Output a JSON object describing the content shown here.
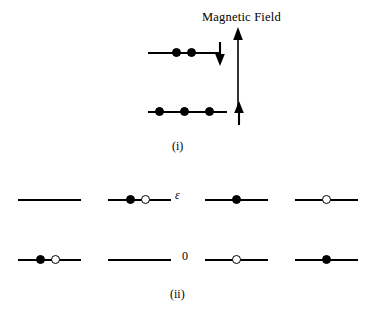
{
  "figure": {
    "title": "Magnetic Field",
    "part_i_label": "(i)",
    "part_ii_label": "(ii)",
    "energy_label": "ε",
    "zero_label": "0",
    "colors": {
      "line": "#000000",
      "filled_particle": "#000000",
      "open_particle": "#ffffff",
      "background": "#ffffff"
    }
  },
  "part_i": {
    "name": "spin-configuration-in-magnetic-field",
    "field_arrow": {
      "direction": "up",
      "name": "magnetic-field-arrow"
    },
    "levels": [
      {
        "name": "upper-level",
        "occupancy": 2,
        "particles": [
          "filled",
          "filled"
        ],
        "spin_arrow": "down"
      },
      {
        "name": "lower-level",
        "occupancy": 3,
        "particles": [
          "filled",
          "filled",
          "filled"
        ],
        "spin_arrow": "up"
      }
    ]
  },
  "part_ii": {
    "name": "two-level-microstate-configurations",
    "row_labels": [
      "ε",
      "0"
    ],
    "columns": [
      {
        "name": "microstate-1",
        "upper": [],
        "lower": [
          "filled",
          "open"
        ]
      },
      {
        "name": "microstate-2",
        "upper": [
          "filled",
          "open"
        ],
        "lower": []
      },
      {
        "name": "microstate-3",
        "upper": [
          "filled"
        ],
        "lower": [
          "open"
        ]
      },
      {
        "name": "microstate-4",
        "upper": [
          "open"
        ],
        "lower": [
          "filled"
        ]
      }
    ]
  }
}
